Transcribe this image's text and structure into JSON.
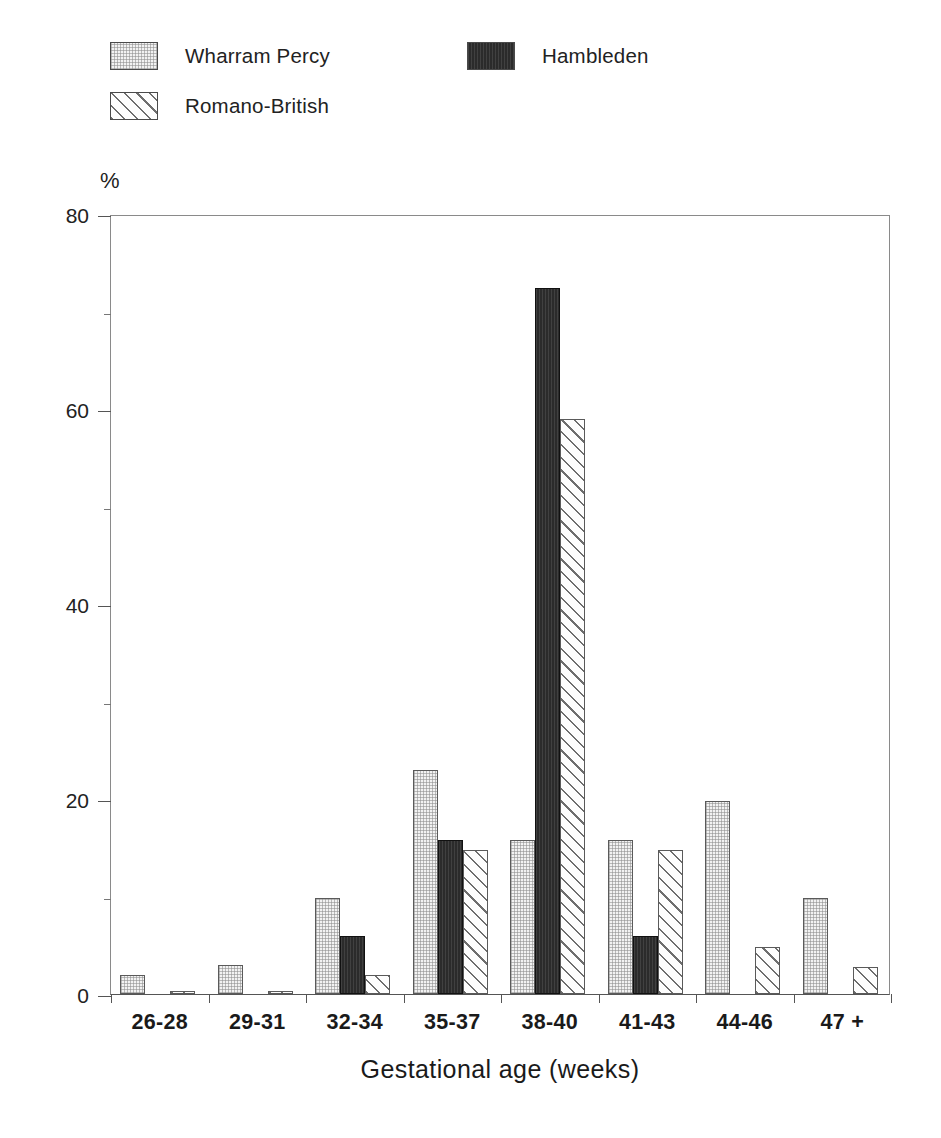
{
  "chart_data": {
    "type": "bar",
    "title": "",
    "subtitle": "",
    "xlabel": "Gestational age (weeks)",
    "ylabel": "%",
    "ylim": [
      0,
      80
    ],
    "yticks": [
      0,
      20,
      40,
      60,
      80
    ],
    "ytick_labels": [
      "0",
      "20",
      "40",
      "60",
      "80"
    ],
    "yminor_ticks": [
      10,
      30,
      50,
      70
    ],
    "grid": false,
    "legend_position": "top-left",
    "categories": [
      "26-28",
      "29-31",
      "32-34",
      "35-37",
      "38-40",
      "41-43",
      "44-46",
      "47 +"
    ],
    "series": [
      {
        "name": "Wharram Percy",
        "fill": "wharram",
        "color": "#f2f2f2",
        "values": [
          2.0,
          3.0,
          9.8,
          23.0,
          15.8,
          15.8,
          19.8,
          9.8
        ]
      },
      {
        "name": "Hambleden",
        "fill": "hambleden",
        "color": "#2b2b2b",
        "values": [
          0,
          0,
          6.0,
          15.8,
          72.4,
          6.0,
          0,
          0
        ]
      },
      {
        "name": "Romano-British",
        "fill": "romano",
        "color": "#ffffff",
        "values": [
          0.3,
          0.3,
          2.0,
          14.8,
          59.0,
          14.8,
          4.8,
          2.8
        ]
      }
    ]
  },
  "legend": {
    "entries": [
      {
        "label": "Wharram Percy"
      },
      {
        "label": "Hambleden"
      },
      {
        "label": "Romano-British"
      }
    ]
  },
  "axes": {
    "y_axis_label": "%",
    "x_axis_title": "Gestational age (weeks)"
  }
}
